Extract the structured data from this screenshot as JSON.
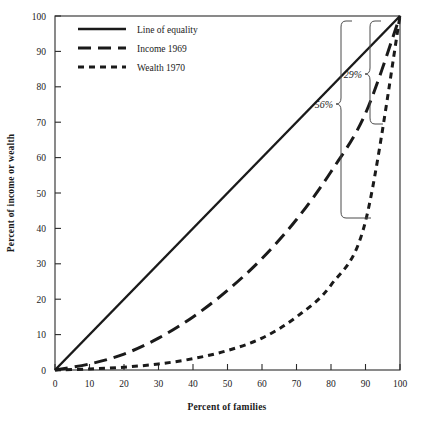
{
  "chart_data": {
    "type": "line",
    "title": "",
    "xlabel": "Percent of families",
    "ylabel": "Percent of income or wealth",
    "xlim": [
      0,
      100
    ],
    "ylim": [
      0,
      100
    ],
    "grid": false,
    "legend_position": "top-left",
    "xticks": [
      "0",
      "10",
      "20",
      "30",
      "40",
      "50",
      "60",
      "70",
      "80",
      "90",
      "100"
    ],
    "yticks": [
      "0",
      "10",
      "20",
      "30",
      "40",
      "50",
      "60",
      "70",
      "80",
      "90",
      "100"
    ],
    "x": [
      0,
      10,
      20,
      30,
      40,
      50,
      60,
      70,
      80,
      90,
      100
    ],
    "series": [
      {
        "name": "Line of equality",
        "style": "solid",
        "values": [
          0,
          10,
          20,
          30,
          40,
          50,
          60,
          70,
          80,
          90,
          100
        ]
      },
      {
        "name": "Income 1969",
        "style": "long-dash",
        "values": [
          0,
          1.7,
          4.5,
          9.0,
          15.0,
          22.5,
          31.5,
          42.5,
          56.0,
          72.5,
          100
        ]
      },
      {
        "name": "Wealth 1970",
        "style": "short-dash",
        "values": [
          0,
          0.3,
          0.8,
          1.7,
          3.2,
          5.5,
          9.0,
          15.0,
          24.0,
          42.0,
          100
        ]
      }
    ],
    "annotations": [
      {
        "label": "56%",
        "at_x": 80,
        "from": "Line of equality",
        "to": "Income 1969"
      },
      {
        "label": "29%",
        "at_x": 90,
        "from": "Line of equality",
        "to": "Wealth 1970"
      }
    ]
  },
  "legend": {
    "items": [
      {
        "label": "Line of equality"
      },
      {
        "label": "Income 1969"
      },
      {
        "label": "Wealth 1970"
      }
    ]
  },
  "colors": {
    "ink": "#1a1a1a",
    "frame": "#2a2a2a",
    "bracket": "#4a4a4a"
  }
}
